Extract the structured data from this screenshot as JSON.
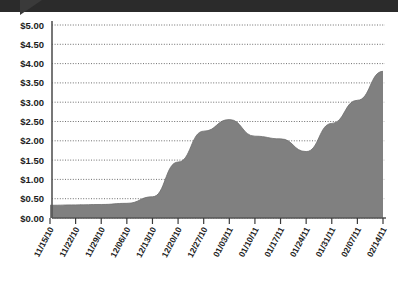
{
  "header": {
    "bar_color": "#2b2b2b",
    "notch_icon": "triangle-pointer-icon"
  },
  "chart_data": {
    "type": "area",
    "title": "",
    "subtitle": "",
    "xlabel": "",
    "ylabel": "",
    "ylim": [
      0,
      5
    ],
    "ytick_step": 0.5,
    "grid": true,
    "legend": "none",
    "series_color": "#808080",
    "categories": [
      "11/15/10",
      "11/22/10",
      "11/29/10",
      "12/06/10",
      "12/13/10",
      "12/20/10",
      "12/27/10",
      "01/03/11",
      "01/10/11",
      "01/17/11",
      "01/24/11",
      "01/31/11",
      "02/07/11",
      "02/14/11"
    ],
    "ytick_labels": [
      "$0.00",
      "$0.50",
      "$1.00",
      "$1.50",
      "$2.00",
      "$2.50",
      "$3.00",
      "$3.50",
      "$4.00",
      "$4.50",
      "$5.00"
    ],
    "ytick_values": [
      0,
      0.5,
      1,
      1.5,
      2,
      2.5,
      3,
      3.5,
      4,
      4.5,
      5
    ],
    "series": [
      {
        "name": "Price",
        "values": [
          0.33,
          0.34,
          0.35,
          0.38,
          0.55,
          1.45,
          2.25,
          2.55,
          2.12,
          2.05,
          1.72,
          2.45,
          3.05,
          3.8
        ]
      }
    ]
  }
}
